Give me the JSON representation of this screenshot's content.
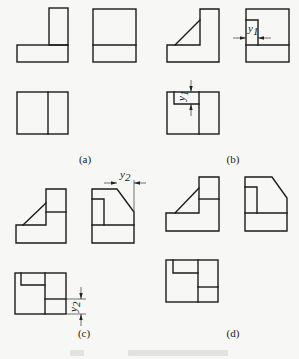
{
  "figure": {
    "panels": [
      {
        "id": "a",
        "label": "(a)",
        "views": [
          "front-view",
          "side-view",
          "top-view"
        ]
      },
      {
        "id": "b",
        "label": "(b)",
        "views": [
          "front-view",
          "side-view",
          "top-view"
        ],
        "dimension": {
          "symbol": "y",
          "subscript": "1"
        }
      },
      {
        "id": "c",
        "label": "(c)",
        "views": [
          "front-view",
          "side-view",
          "top-view"
        ],
        "dimension": {
          "symbol": "y",
          "subscript": "2"
        }
      },
      {
        "id": "d",
        "label": "(d)",
        "views": [
          "front-view",
          "side-view",
          "top-view"
        ]
      }
    ],
    "dim_y1": {
      "symbol": "y",
      "subscript": "1"
    },
    "dim_y2": {
      "symbol": "y",
      "subscript": "2"
    },
    "colors": {
      "line": "#1c1c1c",
      "background": "#f7f7f5"
    }
  }
}
